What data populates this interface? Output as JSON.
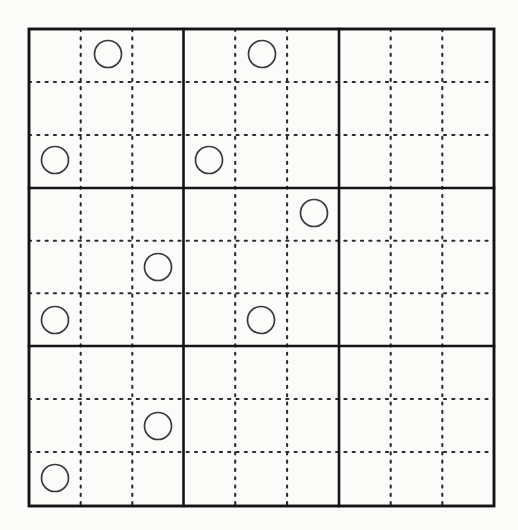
{
  "diagram": {
    "type": "grid-puzzle",
    "background_color": "#fbfbfa",
    "frame": {
      "x": 29,
      "y": 29,
      "width": 465,
      "height": 477,
      "stroke_color": "#141414",
      "stroke_width": 2.9
    },
    "structure": {
      "blocks_across": 3,
      "blocks_down": 3,
      "cells_per_block_across": 3,
      "cells_per_block_down": 3,
      "total_columns": 9,
      "total_rows": 9
    },
    "block_lines": {
      "stroke_color": "#141414",
      "stroke_width": 2.6,
      "vertical_x": [
        183.5,
        339.0
      ],
      "horizontal_y": [
        188.0,
        346.0
      ]
    },
    "cell_lines": {
      "style": "dotted",
      "stroke_color": "#2a2a2a",
      "stroke_width": 2.1,
      "dash_on": 2.1,
      "dash_gap": 6.2,
      "vertical_x": [
        80.7,
        132.3,
        235.2,
        287.1,
        390.7,
        442.3
      ],
      "horizontal_y": [
        82.0,
        135.0,
        240.7,
        293.3,
        399.0,
        452.0
      ]
    },
    "tokens": {
      "shape": "circle",
      "radius": 13.5,
      "stroke_color": "#3a3a3a",
      "stroke_width": 1.7,
      "fill": "none",
      "count": 9,
      "items": [
        {
          "id": "token-1",
          "block_row": 0,
          "block_col": 0,
          "cell_row": 0,
          "cell_col": 1,
          "cx": 108,
          "cy": 54
        },
        {
          "id": "token-2",
          "block_row": 0,
          "block_col": 0,
          "cell_row": 2,
          "cell_col": 0,
          "cx": 55,
          "cy": 160
        },
        {
          "id": "token-3",
          "block_row": 0,
          "block_col": 1,
          "cell_row": 0,
          "cell_col": 1,
          "cx": 262,
          "cy": 54
        },
        {
          "id": "token-4",
          "block_row": 0,
          "block_col": 1,
          "cell_row": 2,
          "cell_col": 0,
          "cx": 209,
          "cy": 160
        },
        {
          "id": "token-5",
          "block_row": 1,
          "block_col": 0,
          "cell_row": 1,
          "cell_col": 2,
          "cx": 158,
          "cy": 267
        },
        {
          "id": "token-6",
          "block_row": 1,
          "block_col": 0,
          "cell_row": 2,
          "cell_col": 0,
          "cx": 55,
          "cy": 320
        },
        {
          "id": "token-7",
          "block_row": 1,
          "block_col": 1,
          "cell_row": 0,
          "cell_col": 2,
          "cx": 314,
          "cy": 213
        },
        {
          "id": "token-8",
          "block_row": 1,
          "block_col": 1,
          "cell_row": 2,
          "cell_col": 1,
          "cx": 261,
          "cy": 320
        },
        {
          "id": "token-9",
          "block_row": 2,
          "block_col": 0,
          "cell_row": 1,
          "cell_col": 2,
          "cx": 158,
          "cy": 426
        },
        {
          "id": "token-10",
          "block_row": 2,
          "block_col": 0,
          "cell_row": 2,
          "cell_col": 0,
          "cx": 55,
          "cy": 478
        }
      ]
    },
    "blocks": [
      {
        "id": "block-0-0",
        "row": 0,
        "col": 0,
        "token_count": 2
      },
      {
        "id": "block-0-1",
        "row": 0,
        "col": 1,
        "token_count": 2
      },
      {
        "id": "block-0-2",
        "row": 0,
        "col": 2,
        "token_count": 0
      },
      {
        "id": "block-1-0",
        "row": 1,
        "col": 0,
        "token_count": 2
      },
      {
        "id": "block-1-1",
        "row": 1,
        "col": 1,
        "token_count": 2
      },
      {
        "id": "block-1-2",
        "row": 1,
        "col": 2,
        "token_count": 0
      },
      {
        "id": "block-2-0",
        "row": 2,
        "col": 0,
        "token_count": 2
      },
      {
        "id": "block-2-1",
        "row": 2,
        "col": 1,
        "token_count": 0
      },
      {
        "id": "block-2-2",
        "row": 2,
        "col": 2,
        "token_count": 0
      }
    ]
  }
}
